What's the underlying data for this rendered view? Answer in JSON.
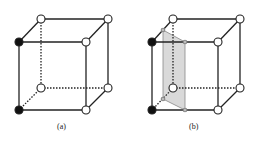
{
  "figure": {
    "panels": [
      {
        "id": "a",
        "label": "(a)",
        "black_vertices": [
          "front-top-left",
          "front-bottom-left"
        ],
        "shaded_plane": false
      },
      {
        "id": "b",
        "label": "(b)",
        "black_vertices": [
          "front-top-left",
          "front-bottom-left"
        ],
        "shaded_plane": true
      }
    ],
    "colors": {
      "edge": "#222222",
      "filled_vertex": "#111111",
      "open_vertex": "#ffffff",
      "plane": "#d9d9d9"
    }
  }
}
